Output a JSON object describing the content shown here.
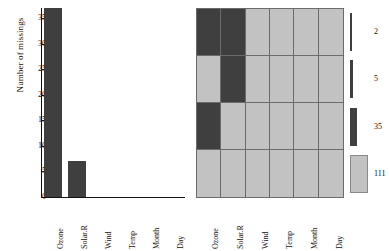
{
  "chart_data": [
    {
      "type": "bar",
      "title": "",
      "xlabel": "",
      "ylabel": "Number of missings",
      "categories": [
        "Ozone",
        "Solar.R",
        "Wind",
        "Temp",
        "Month",
        "Day"
      ],
      "values": [
        37,
        7,
        0,
        0,
        0,
        0
      ],
      "ylim": [
        0,
        37
      ],
      "yticks": [
        0,
        5,
        10,
        15,
        20,
        25,
        30,
        35
      ],
      "grid": false,
      "legend": "none",
      "bar_color": "#3f3f3f"
    },
    {
      "type": "heatmap",
      "title": "",
      "xlabel": "",
      "ylabel": "Combinations",
      "categories": [
        "Ozone",
        "Solar.R",
        "Wind",
        "Temp",
        "Month",
        "Day"
      ],
      "rows": [
        {
          "pattern": [
            1,
            1,
            0,
            0,
            0,
            0
          ],
          "count": 2
        },
        {
          "pattern": [
            0,
            1,
            0,
            0,
            0,
            0
          ],
          "count": 5
        },
        {
          "pattern": [
            1,
            0,
            0,
            0,
            0,
            0
          ],
          "count": 35
        },
        {
          "pattern": [
            0,
            0,
            0,
            0,
            0,
            0
          ],
          "count": 111
        }
      ],
      "value_labels": [
        "1 = missing",
        "0 = observed"
      ],
      "colors": {
        "missing": "#3f3f3f",
        "observed": "#c2c2c2",
        "gridline": "#6b6b6b"
      },
      "legend": "right",
      "grid": true
    }
  ],
  "barplot": {
    "ylabel": "Number of missings",
    "yticks": [
      "35",
      "30",
      "25",
      "20",
      "15",
      "10",
      "5",
      "0"
    ],
    "xlabels": [
      "Ozone",
      "Solar.R",
      "Wind",
      "Temp",
      "Month",
      "Day"
    ]
  },
  "combination": {
    "ylabel": "Combinations",
    "xlabels": [
      "Ozone",
      "Solar.R",
      "Wind",
      "Temp",
      "Month",
      "Day"
    ]
  },
  "legend": {
    "counts": [
      "2",
      "5",
      "35",
      "111"
    ]
  },
  "colors": {
    "missing": "#3f3f3f",
    "observed": "#c2c2c2",
    "axis": "#111111",
    "gridline": "#6b6b6b",
    "background": "#ffffff"
  }
}
